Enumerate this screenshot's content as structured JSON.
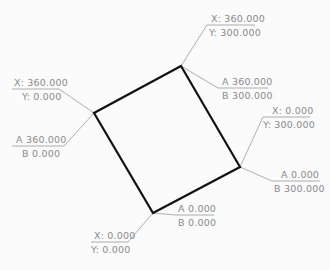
{
  "drawing": {
    "shape": {
      "stroke_color": "#111111",
      "corners": [
        {
          "id": "top",
          "x": 181,
          "y": 66
        },
        {
          "id": "right",
          "x": 240,
          "y": 167
        },
        {
          "id": "bottom",
          "x": 153,
          "y": 213
        },
        {
          "id": "left",
          "x": 94,
          "y": 113
        }
      ]
    },
    "leader_color": "#9a9a9a",
    "labels": {
      "top_xy": {
        "line1": "X: 360.000",
        "line2": "Y: 300.000"
      },
      "top_ab": {
        "line1": "A  360.000",
        "line2": "B  300.000"
      },
      "left_xy": {
        "line1": "X: 360.000",
        "line2": "Y: 0.000"
      },
      "left_ab": {
        "line1": "A  360.000",
        "line2": "B  0.000"
      },
      "right_xy": {
        "line1": "X: 0.000",
        "line2": "Y: 300.000"
      },
      "right_ab": {
        "line1": "A  0.000",
        "line2": "B  300.000"
      },
      "bottom_xy": {
        "line1": "X: 0.000",
        "line2": "Y: 0.000"
      },
      "bottom_ab": {
        "line1": "A  0.000",
        "line2": "B  0.000"
      }
    }
  }
}
